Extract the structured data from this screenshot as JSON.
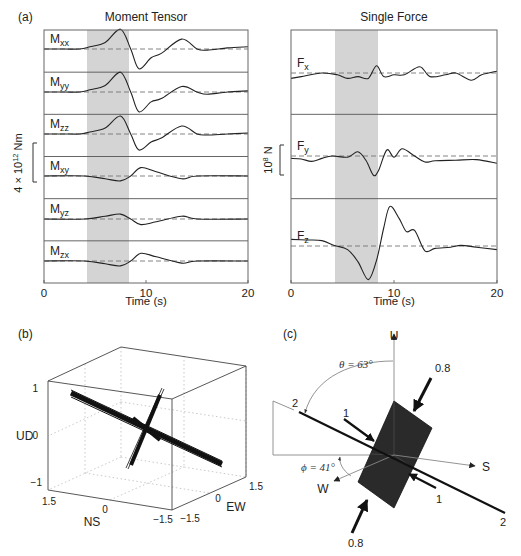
{
  "figure": {
    "panel_a_label": "(a)",
    "panel_b_label": "(b)",
    "panel_c_label": "(c)"
  },
  "chart_data": [
    {
      "type": "line",
      "title": "Moment Tensor",
      "xlabel": "Time (s)",
      "ylabel": "4 × 10^12 Nm",
      "ylabel_parts": {
        "main": "4 × 10",
        "sup": "12",
        "unit": " Nm"
      },
      "xlim": [
        0,
        20
      ],
      "x_ticks": [
        "0",
        "10",
        "20"
      ],
      "shaded_interval_s": [
        4.2,
        8.4
      ],
      "grid": false,
      "traces": [
        {
          "name": "Mxx",
          "label_main": "M",
          "label_sub": "xx",
          "amplitude": 1.0,
          "t": [
            0,
            2,
            3.5,
            4.5,
            6,
            7.5,
            8.5,
            9.3,
            10.5,
            11.5,
            13.5,
            15,
            16,
            18,
            20
          ],
          "v": [
            0,
            0,
            0,
            0.1,
            0.3,
            0.9,
            0,
            -0.9,
            -0.4,
            -0.2,
            0.45,
            0,
            -0.05,
            0.05,
            0.1
          ]
        },
        {
          "name": "Myy",
          "label_main": "M",
          "label_sub": "yy",
          "amplitude": 0.9,
          "t": [
            0,
            2,
            3.5,
            4.5,
            6,
            7.5,
            8.5,
            9.3,
            10.5,
            11.5,
            13.5,
            15,
            16,
            18,
            20
          ],
          "v": [
            0,
            0,
            0,
            0.1,
            0.3,
            0.9,
            0,
            -0.9,
            -0.45,
            -0.3,
            0.25,
            0,
            -0.1,
            0,
            0.05
          ]
        },
        {
          "name": "Mzz",
          "label_main": "M",
          "label_sub": "zz",
          "amplitude": 0.65,
          "t": [
            0,
            2,
            3.5,
            4.5,
            6,
            7.5,
            8.5,
            9.3,
            10.5,
            11.5,
            13.5,
            15,
            16,
            18,
            20
          ],
          "v": [
            0,
            0,
            0,
            0.1,
            0.3,
            0.9,
            0,
            -0.8,
            -0.4,
            -0.2,
            0.4,
            0,
            -0.05,
            0,
            0.05
          ]
        },
        {
          "name": "Mxy",
          "label_main": "M",
          "label_sub": "xy",
          "amplitude": 0.2,
          "t": [
            0,
            4,
            6,
            7.5,
            8.5,
            9.5,
            11,
            13.5,
            15,
            20
          ],
          "v": [
            0,
            0,
            -0.2,
            -0.35,
            0,
            0.6,
            0.3,
            -0.2,
            0,
            0
          ]
        },
        {
          "name": "Myz",
          "label_main": "M",
          "label_sub": "yz",
          "amplitude": 0.2,
          "t": [
            0,
            4,
            6,
            7.5,
            8.5,
            9.5,
            11,
            13.5,
            15,
            20
          ],
          "v": [
            0,
            0,
            0.2,
            0.35,
            0,
            -0.4,
            -0.2,
            0.2,
            0,
            0
          ]
        },
        {
          "name": "Mzx",
          "label_main": "M",
          "label_sub": "zx",
          "amplitude": 0.25,
          "t": [
            0,
            4,
            6,
            7.5,
            8.5,
            9.5,
            11,
            13.5,
            15,
            20
          ],
          "v": [
            0,
            0,
            -0.2,
            -0.35,
            0,
            0.55,
            0.3,
            -0.15,
            0,
            0
          ]
        }
      ]
    },
    {
      "type": "line",
      "title": "Single Force",
      "xlabel": "Time (s)",
      "ylabel": "10^8 N",
      "ylabel_parts": {
        "main": "10",
        "sup": "8",
        "unit": " N"
      },
      "xlim": [
        0,
        20
      ],
      "x_ticks": [
        "0",
        "10",
        "20"
      ],
      "shaded_interval_s": [
        4.2,
        8.4
      ],
      "grid": false,
      "traces": [
        {
          "name": "Fx",
          "label_main": "F",
          "label_sub": "x",
          "t": [
            0,
            1,
            3,
            4.5,
            5.5,
            6.5,
            7.5,
            8.3,
            9,
            10,
            11,
            12.5,
            13.5,
            15,
            16,
            17.5,
            18.5,
            20
          ],
          "v": [
            -0.3,
            -0.2,
            0,
            -0.1,
            -0.3,
            -0.2,
            -0.3,
            0.4,
            -0.2,
            -0.1,
            -0.1,
            0.35,
            -0.2,
            -0.1,
            0,
            -0.4,
            -0.1,
            0.1
          ]
        },
        {
          "name": "Fy",
          "label_main": "F",
          "label_sub": "y",
          "t": [
            0,
            1,
            2,
            3,
            4,
            5.5,
            6.5,
            7.3,
            8,
            8.5,
            9.3,
            10,
            10.8,
            12,
            13,
            14,
            16,
            18,
            20
          ],
          "v": [
            -0.2,
            -0.25,
            -0.45,
            -0.2,
            0,
            -0.1,
            0.35,
            -0.4,
            -1.6,
            -1.2,
            0.5,
            -0.1,
            0.6,
            0,
            -0.5,
            -0.4,
            -0.35,
            -0.3,
            -0.6
          ]
        },
        {
          "name": "Fz",
          "label_main": "F",
          "label_sub": "z",
          "t": [
            0,
            1.5,
            3,
            4.2,
            5.5,
            6.5,
            7.5,
            8.3,
            9,
            9.6,
            10.5,
            11.2,
            12,
            13,
            14,
            15.5,
            16.5,
            18,
            20
          ],
          "v": [
            0.55,
            0.5,
            0.45,
            0.05,
            -0.3,
            -1.3,
            -2.8,
            -1.2,
            1.5,
            3.3,
            2.3,
            1.2,
            1.3,
            -0.4,
            -0.2,
            -0.1,
            0.05,
            -0.1,
            -0.3
          ]
        }
      ]
    },
    {
      "type": "scatter",
      "subtype": "3d_lines",
      "xlabel": "NS",
      "ylabel": "EW",
      "zlabel": "UD",
      "ns_ticks": [
        "1.5",
        "0",
        "−1.5"
      ],
      "ew_ticks": [
        "−1.5",
        "0",
        "1.5"
      ],
      "ud_ticks": [
        "1",
        "0",
        "−1"
      ],
      "xlim": [
        -1.5,
        1.5
      ],
      "ylim": [
        -1.5,
        1.5
      ],
      "zlim": [
        -1,
        1
      ],
      "grid": true,
      "description": "Bundles of principal-axis lines through origin: long bundle (axis 2) and shorter crossing bundle (axis 1)"
    },
    {
      "type": "diagram",
      "axis_labels": {
        "up": "U",
        "south": "S",
        "west": "W"
      },
      "theta_label": "θ = 63°",
      "phi_label": "ϕ = 41°",
      "axis_line_label": "2",
      "force_labels": {
        "top": "0.8",
        "bottom": "0.8",
        "left": "1",
        "right": "1"
      }
    }
  ]
}
